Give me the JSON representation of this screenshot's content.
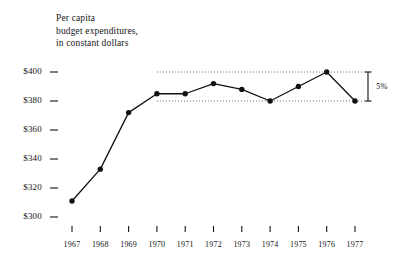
{
  "chart_data": {
    "type": "line",
    "title": "Per capita budget expenditures, in constant dollars",
    "title_lines": [
      "Per capita",
      "budget expenditures,",
      "in constant dollars"
    ],
    "xlabel": "",
    "ylabel": "",
    "categories": [
      "1967",
      "1968",
      "1969",
      "1970",
      "1971",
      "1972",
      "1973",
      "1974",
      "1975",
      "1976",
      "1977"
    ],
    "values": [
      311,
      333,
      372,
      385,
      385,
      392,
      388,
      380,
      390,
      400,
      380
    ],
    "ylim": [
      300,
      400
    ],
    "ytick_values": [
      400,
      380,
      360,
      340,
      320,
      300
    ],
    "ytick_labels": [
      "$400",
      "$380",
      "$360",
      "$340",
      "$320",
      "$300"
    ],
    "grid": false,
    "legend": "none",
    "reference_lines": [
      {
        "value": 400,
        "style": "dotted",
        "from_category": "1970",
        "to_category": "1977"
      },
      {
        "value": 380,
        "style": "dotted",
        "from_category": "1970",
        "to_category": "1977"
      }
    ],
    "annotations": [
      {
        "name": "range-bracket",
        "label": "5%",
        "from_value": 380,
        "to_value": 400,
        "position": "right"
      }
    ],
    "marker": "filled-circle",
    "line_color": "#111111",
    "marker_color": "#111111"
  },
  "axes": {
    "y_ticks": [
      {
        "label": "$400",
        "value": 400
      },
      {
        "label": "$380",
        "value": 380
      },
      {
        "label": "$360",
        "value": 360
      },
      {
        "label": "$340",
        "value": 340
      },
      {
        "label": "$320",
        "value": 320
      },
      {
        "label": "$300",
        "value": 300
      }
    ],
    "x_ticks": [
      {
        "label": "1967"
      },
      {
        "label": "1968"
      },
      {
        "label": "1969"
      },
      {
        "label": "1970"
      },
      {
        "label": "1971"
      },
      {
        "label": "1972"
      },
      {
        "label": "1973"
      },
      {
        "label": "1974"
      },
      {
        "label": "1975"
      },
      {
        "label": "1976"
      },
      {
        "label": "1977"
      }
    ]
  },
  "annotation": {
    "bracket_label": "5%"
  },
  "colors": {
    "ink": "#111111",
    "background": "#ffffff",
    "reference_line": "#555555"
  }
}
